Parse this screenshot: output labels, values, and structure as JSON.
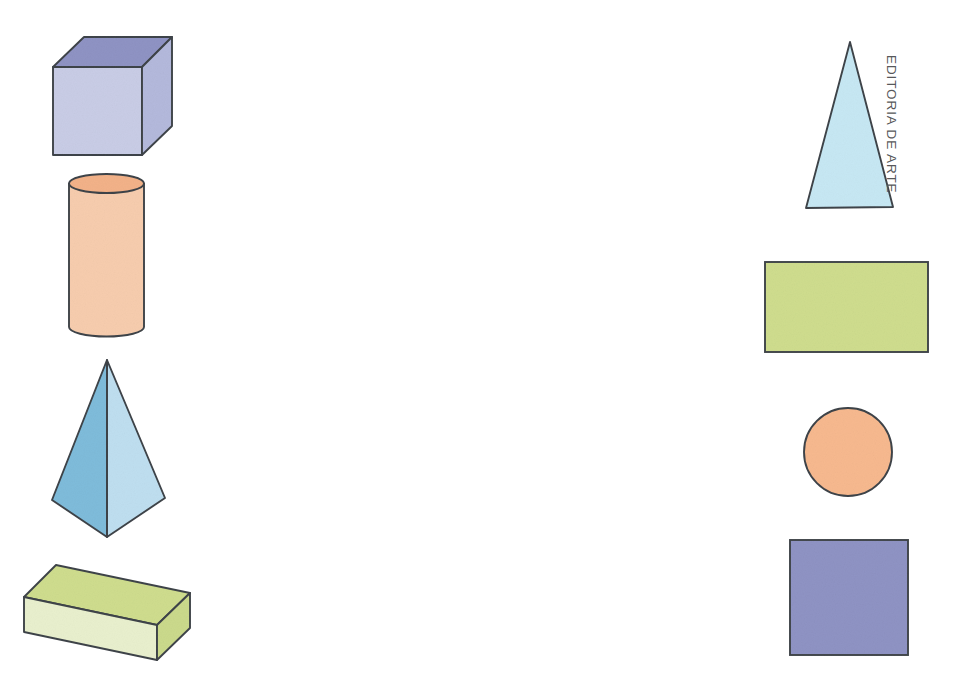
{
  "page": {
    "background_color": "#ffffff",
    "width": 964,
    "height": 683
  },
  "credit": {
    "text": "EDITORIA DE ARTE",
    "color": "#57585a",
    "rotation_deg": 90
  },
  "palette": {
    "outline": "#3f4449",
    "cube_front": "#c9cde6",
    "cube_top": "#8f93c4",
    "cube_right": "#b4b9dc",
    "cylinder_body": "#f7cdae",
    "cylinder_top": "#f3b289",
    "pyramid_left": "#7fbcdb",
    "pyramid_right": "#bfdff0",
    "prism_top": "#cfdd8e",
    "prism_front": "#e9f0ce",
    "prism_right": "#cbda8c",
    "triangle_fill": "#c7e8f4",
    "rectangle_fill": "#cfdd8e",
    "circle_fill": "#f7b98f",
    "square_fill": "#8f93c4"
  },
  "shapes": {
    "solids_column": {
      "label": "Geometric solids",
      "items": [
        {
          "name": "cube",
          "label": "Cube",
          "type": "solid",
          "fill_front": "#c9cde6",
          "fill_top": "#8f93c4",
          "fill_right": "#b4b9dc",
          "bbox": [
            53,
            37,
            119,
            118
          ]
        },
        {
          "name": "cylinder",
          "label": "Cylinder",
          "type": "solid",
          "fill_body": "#f7cdae",
          "fill_top": "#f3b289",
          "bbox": [
            69,
            175,
            76,
            161
          ]
        },
        {
          "name": "pyramid",
          "label": "Square pyramid",
          "type": "solid",
          "fill_left": "#7fbcdb",
          "fill_right": "#bfdff0",
          "bbox": [
            52,
            360,
            113,
            177
          ]
        },
        {
          "name": "rectangular-prism",
          "label": "Rectangular prism",
          "type": "solid",
          "fill_top": "#cfdd8e",
          "fill_front": "#e9f0ce",
          "fill_right": "#cbda8c",
          "bbox": [
            24,
            565,
            166,
            95
          ]
        }
      ]
    },
    "plane_column": {
      "label": "Plane figures",
      "items": [
        {
          "name": "triangle",
          "label": "Triangle",
          "type": "plane",
          "fill": "#c7e8f4",
          "bbox": [
            806,
            42,
            87,
            166
          ]
        },
        {
          "name": "rectangle",
          "label": "Rectangle",
          "type": "plane",
          "fill": "#cfdd8e",
          "bbox": [
            765,
            262,
            163,
            90
          ]
        },
        {
          "name": "circle",
          "label": "Circle",
          "type": "plane",
          "fill": "#f7b98f",
          "bbox": [
            804,
            408,
            88,
            88
          ]
        },
        {
          "name": "square",
          "label": "Square",
          "type": "plane",
          "fill": "#8f93c4",
          "bbox": [
            790,
            540,
            118,
            115
          ]
        }
      ]
    }
  }
}
